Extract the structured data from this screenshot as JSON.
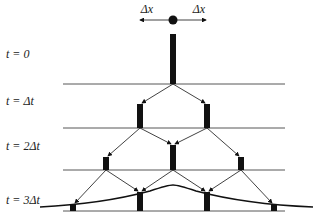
{
  "diagram": {
    "top_labels": {
      "left": "Δx",
      "right": "Δx"
    },
    "time_labels": [
      {
        "t": "t",
        "eq": " = ",
        "val": "0"
      },
      {
        "t": "t",
        "eq": " = ",
        "val": "Δt"
      },
      {
        "t": "t",
        "eq": " = ",
        "val": "2Δt"
      },
      {
        "t": "t",
        "eq": " = ",
        "val": "3Δt"
      }
    ],
    "time_label_text": [
      "t = 0",
      "t = Δt",
      "t = 2Δt",
      "t = 3Δt"
    ],
    "levels": [
      {
        "bars": [
          {
            "x": 173,
            "height": 50
          }
        ]
      },
      {
        "bars": [
          {
            "x": 140,
            "height": 23
          },
          {
            "x": 207,
            "height": 23
          }
        ]
      },
      {
        "bars": [
          {
            "x": 106,
            "height": 12
          },
          {
            "x": 173,
            "height": 25
          },
          {
            "x": 241,
            "height": 12
          }
        ]
      },
      {
        "bars": [
          {
            "x": 73,
            "height": 6
          },
          {
            "x": 140,
            "height": 18
          },
          {
            "x": 207,
            "height": 18
          },
          {
            "x": 274,
            "height": 6
          }
        ]
      }
    ],
    "colors": {
      "ink": "#111111",
      "line": "#444444"
    }
  }
}
